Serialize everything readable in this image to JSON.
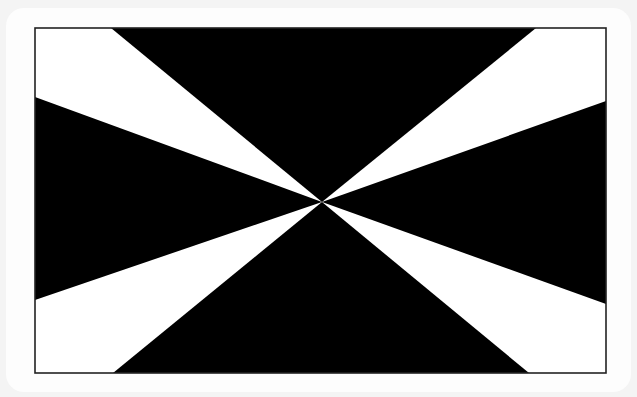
{
  "figure": {
    "colors": {
      "background": "#f4f4f4",
      "card": "#fdfdfd",
      "field": "#ffffff",
      "wedge": "#000000",
      "frame": "#222222"
    },
    "frame": {
      "x1": 35,
      "y1": 28,
      "x2": 606,
      "y2": 373
    },
    "center": {
      "x": 322,
      "y": 202
    },
    "black_wedges": [
      {
        "name": "top",
        "points": "111,28 536,28 322,202"
      },
      {
        "name": "right",
        "points": "606,101 606,304 322,202"
      },
      {
        "name": "bottom",
        "points": "113,373 529,373 322,202"
      },
      {
        "name": "left",
        "points": "35,97 35,300 322,202"
      }
    ]
  }
}
